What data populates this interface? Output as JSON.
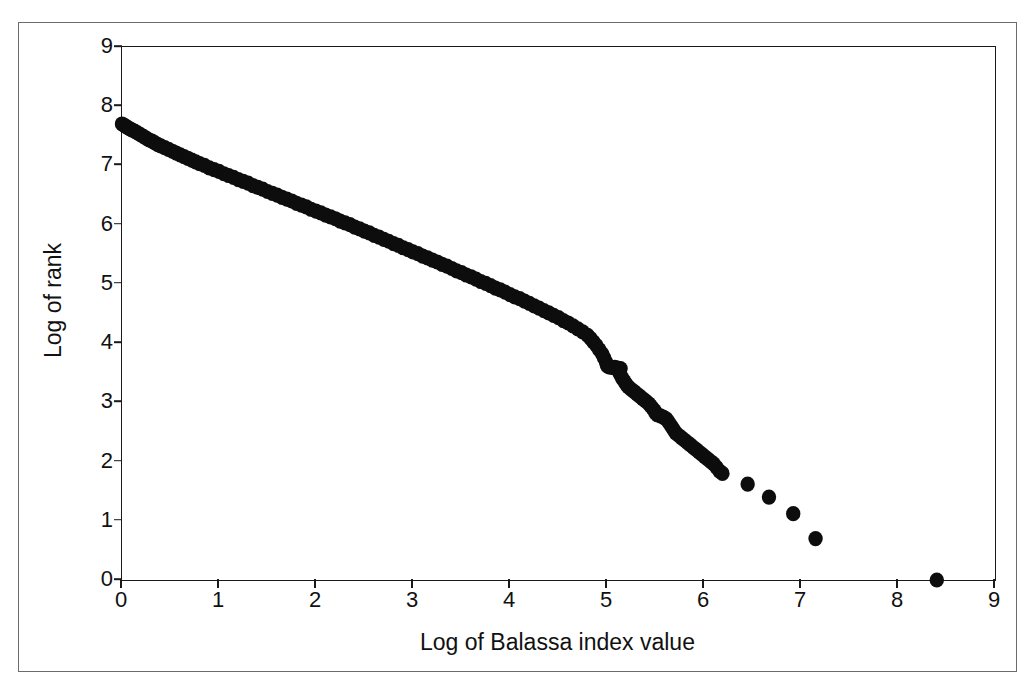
{
  "axes": {
    "x_title": "Log of Balassa index value",
    "y_title": "Log of rank",
    "x_ticks": [
      "0",
      "1",
      "2",
      "3",
      "4",
      "5",
      "6",
      "7",
      "8",
      "9"
    ],
    "y_ticks": [
      "0",
      "1",
      "2",
      "3",
      "4",
      "5",
      "6",
      "7",
      "8",
      "9"
    ]
  },
  "colors": {
    "marker": "#0d0d0d",
    "axis": "#1a1a1a",
    "frame": "#6b6b6b",
    "background": "#ffffff"
  },
  "chart_data": {
    "type": "scatter",
    "title": "",
    "xlabel": "Log of Balassa index value",
    "ylabel": "Log of rank",
    "xlim": [
      0,
      9
    ],
    "ylim": [
      0,
      9
    ],
    "xticks": [
      0,
      1,
      2,
      3,
      4,
      5,
      6,
      7,
      8,
      9
    ],
    "yticks": [
      0,
      1,
      2,
      3,
      4,
      5,
      6,
      7,
      8,
      9
    ],
    "grid": false,
    "legend": null,
    "marker": "filled-circle",
    "marker_color": "#0d0d0d",
    "series": [
      {
        "name": "Balassa index rank-size distribution",
        "points": [
          [
            0.0,
            7.7
          ],
          [
            0.02,
            7.68
          ],
          [
            0.04,
            7.66
          ],
          [
            0.06,
            7.64
          ],
          [
            0.08,
            7.62
          ],
          [
            0.1,
            7.6
          ],
          [
            0.13,
            7.58
          ],
          [
            0.16,
            7.55
          ],
          [
            0.19,
            7.52
          ],
          [
            0.22,
            7.49
          ],
          [
            0.25,
            7.46
          ],
          [
            0.28,
            7.43
          ],
          [
            0.31,
            7.41
          ],
          [
            0.34,
            7.38
          ],
          [
            0.37,
            7.35
          ],
          [
            0.4,
            7.33
          ],
          [
            0.44,
            7.3
          ],
          [
            0.48,
            7.27
          ],
          [
            0.52,
            7.24
          ],
          [
            0.56,
            7.21
          ],
          [
            0.6,
            7.18
          ],
          [
            0.64,
            7.15
          ],
          [
            0.68,
            7.12
          ],
          [
            0.72,
            7.09
          ],
          [
            0.76,
            7.06
          ],
          [
            0.8,
            7.03
          ],
          [
            0.85,
            7.0
          ],
          [
            0.9,
            6.96
          ],
          [
            0.95,
            6.93
          ],
          [
            1.0,
            6.9
          ],
          [
            1.05,
            6.86
          ],
          [
            1.1,
            6.83
          ],
          [
            1.15,
            6.8
          ],
          [
            1.2,
            6.76
          ],
          [
            1.25,
            6.73
          ],
          [
            1.3,
            6.7
          ],
          [
            1.35,
            6.66
          ],
          [
            1.4,
            6.63
          ],
          [
            1.45,
            6.6
          ],
          [
            1.5,
            6.56
          ],
          [
            1.55,
            6.53
          ],
          [
            1.6,
            6.5
          ],
          [
            1.65,
            6.46
          ],
          [
            1.7,
            6.43
          ],
          [
            1.75,
            6.4
          ],
          [
            1.8,
            6.36
          ],
          [
            1.85,
            6.33
          ],
          [
            1.9,
            6.3
          ],
          [
            1.95,
            6.26
          ],
          [
            2.0,
            6.23
          ],
          [
            2.05,
            6.2
          ],
          [
            2.1,
            6.16
          ],
          [
            2.15,
            6.13
          ],
          [
            2.2,
            6.1
          ],
          [
            2.25,
            6.06
          ],
          [
            2.3,
            6.03
          ],
          [
            2.35,
            6.0
          ],
          [
            2.4,
            5.96
          ],
          [
            2.45,
            5.93
          ],
          [
            2.5,
            5.89
          ],
          [
            2.55,
            5.86
          ],
          [
            2.6,
            5.82
          ],
          [
            2.65,
            5.79
          ],
          [
            2.7,
            5.75
          ],
          [
            2.75,
            5.72
          ],
          [
            2.8,
            5.68
          ],
          [
            2.85,
            5.65
          ],
          [
            2.9,
            5.61
          ],
          [
            2.95,
            5.58
          ],
          [
            3.0,
            5.54
          ],
          [
            3.05,
            5.51
          ],
          [
            3.1,
            5.47
          ],
          [
            3.15,
            5.44
          ],
          [
            3.2,
            5.4
          ],
          [
            3.25,
            5.37
          ],
          [
            3.3,
            5.33
          ],
          [
            3.35,
            5.3
          ],
          [
            3.4,
            5.26
          ],
          [
            3.45,
            5.22
          ],
          [
            3.5,
            5.19
          ],
          [
            3.55,
            5.15
          ],
          [
            3.6,
            5.12
          ],
          [
            3.65,
            5.08
          ],
          [
            3.7,
            5.04
          ],
          [
            3.75,
            5.01
          ],
          [
            3.8,
            4.97
          ],
          [
            3.85,
            4.93
          ],
          [
            3.9,
            4.9
          ],
          [
            3.95,
            4.86
          ],
          [
            4.0,
            4.82
          ],
          [
            4.05,
            4.78
          ],
          [
            4.1,
            4.75
          ],
          [
            4.15,
            4.71
          ],
          [
            4.2,
            4.67
          ],
          [
            4.25,
            4.63
          ],
          [
            4.3,
            4.59
          ],
          [
            4.35,
            4.55
          ],
          [
            4.4,
            4.51
          ],
          [
            4.45,
            4.47
          ],
          [
            4.5,
            4.43
          ],
          [
            4.55,
            4.38
          ],
          [
            4.6,
            4.34
          ],
          [
            4.65,
            4.29
          ],
          [
            4.7,
            4.24
          ],
          [
            4.75,
            4.19
          ],
          [
            4.8,
            4.13
          ],
          [
            4.83,
            4.08
          ],
          [
            4.86,
            4.02
          ],
          [
            4.89,
            3.96
          ],
          [
            4.92,
            3.89
          ],
          [
            4.95,
            3.82
          ],
          [
            4.97,
            3.75
          ],
          [
            4.99,
            3.68
          ],
          [
            5.0,
            3.62
          ],
          [
            5.02,
            3.6
          ],
          [
            5.05,
            3.59
          ],
          [
            5.08,
            3.59
          ],
          [
            5.11,
            3.58
          ],
          [
            5.14,
            3.57
          ],
          [
            5.12,
            3.52
          ],
          [
            5.14,
            3.46
          ],
          [
            5.16,
            3.4
          ],
          [
            5.18,
            3.35
          ],
          [
            5.2,
            3.3
          ],
          [
            5.22,
            3.26
          ],
          [
            5.25,
            3.22
          ],
          [
            5.28,
            3.18
          ],
          [
            5.31,
            3.14
          ],
          [
            5.34,
            3.1
          ],
          [
            5.37,
            3.06
          ],
          [
            5.4,
            3.02
          ],
          [
            5.43,
            2.98
          ],
          [
            5.45,
            2.94
          ],
          [
            5.47,
            2.9
          ],
          [
            5.49,
            2.86
          ],
          [
            5.5,
            2.82
          ],
          [
            5.52,
            2.79
          ],
          [
            5.55,
            2.77
          ],
          [
            5.58,
            2.75
          ],
          [
            5.61,
            2.72
          ],
          [
            5.63,
            2.68
          ],
          [
            5.65,
            2.63
          ],
          [
            5.67,
            2.58
          ],
          [
            5.69,
            2.53
          ],
          [
            5.71,
            2.48
          ],
          [
            5.74,
            2.44
          ],
          [
            5.77,
            2.4
          ],
          [
            5.8,
            2.36
          ],
          [
            5.83,
            2.32
          ],
          [
            5.86,
            2.28
          ],
          [
            5.89,
            2.24
          ],
          [
            5.92,
            2.2
          ],
          [
            5.95,
            2.16
          ],
          [
            5.98,
            2.12
          ],
          [
            6.01,
            2.08
          ],
          [
            6.04,
            2.04
          ],
          [
            6.07,
            2.0
          ],
          [
            6.1,
            1.96
          ],
          [
            6.13,
            1.9
          ],
          [
            6.16,
            1.84
          ],
          [
            6.19,
            1.8
          ],
          [
            6.45,
            1.62
          ],
          [
            6.67,
            1.4
          ],
          [
            6.92,
            1.12
          ],
          [
            7.15,
            0.7
          ],
          [
            8.4,
            0.0
          ]
        ]
      }
    ],
    "annotations": [
      {
        "text": "plateau near x=5.0 at y=3.6",
        "x": 5.05,
        "y": 3.59
      }
    ]
  }
}
